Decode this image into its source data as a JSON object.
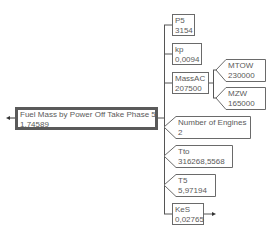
{
  "diagram": {
    "root": {
      "label": "Fuel Mass by Power Off Take Phase 5",
      "value": "1,74589"
    },
    "inputs": [
      {
        "label": "P5",
        "value": "3154",
        "shape": "box"
      },
      {
        "label": "kp",
        "value": "0,0094",
        "shape": "box"
      },
      {
        "label": "MassAC",
        "value": "207500",
        "shape": "box",
        "inputs": [
          {
            "label": "MTOW",
            "value": "230000",
            "shape": "arrow"
          },
          {
            "label": "MZW",
            "value": "165000",
            "shape": "arrow"
          }
        ]
      },
      {
        "label": "Number of Engines",
        "value": "2",
        "shape": "arrow"
      },
      {
        "label": "Tto",
        "value": "316268,5568",
        "shape": "arrow"
      },
      {
        "label": "T5",
        "value": "5,97194",
        "shape": "arrow"
      },
      {
        "label": "KeS",
        "value": "0,02765",
        "shape": "box"
      }
    ]
  }
}
